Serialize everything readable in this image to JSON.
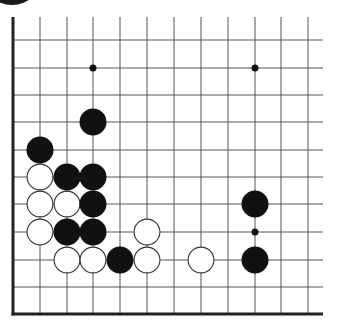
{
  "diagram": {
    "type": "go-board-fragment",
    "colors": {
      "background": "#ffffff",
      "line": "#555555",
      "border": "#222222",
      "black_stone": "#111111",
      "white_stone_fill": "#ffffff",
      "white_stone_outline": "#333333",
      "star_point": "#111111"
    },
    "grid": {
      "columns_x": [
        13,
        40,
        67,
        93,
        120,
        147,
        174,
        201,
        228,
        255,
        281,
        308
      ],
      "rows_y": [
        40,
        68,
        95,
        122,
        150,
        177,
        204,
        232,
        260,
        287,
        314
      ],
      "top_extent_y": 17,
      "right_extent_x": 323,
      "left_border": true,
      "bottom_border": true,
      "stone_radius": 13.5,
      "star_point_radius": 3.5
    },
    "star_points": [
      {
        "col": 3,
        "row": 1
      },
      {
        "col": 9,
        "row": 1
      },
      {
        "col": 9,
        "row": 7
      }
    ],
    "stones": [
      {
        "color": "black",
        "col": 3,
        "row": 3
      },
      {
        "color": "black",
        "col": 1,
        "row": 4
      },
      {
        "color": "white",
        "col": 1,
        "row": 5
      },
      {
        "color": "black",
        "col": 2,
        "row": 5
      },
      {
        "color": "black",
        "col": 3,
        "row": 5
      },
      {
        "color": "white",
        "col": 1,
        "row": 6
      },
      {
        "color": "white",
        "col": 2,
        "row": 6
      },
      {
        "color": "black",
        "col": 3,
        "row": 6
      },
      {
        "color": "black",
        "col": 9,
        "row": 6
      },
      {
        "color": "white",
        "col": 1,
        "row": 7
      },
      {
        "color": "black",
        "col": 2,
        "row": 7
      },
      {
        "color": "black",
        "col": 3,
        "row": 7
      },
      {
        "color": "white",
        "col": 5,
        "row": 7
      },
      {
        "color": "white",
        "col": 2,
        "row": 8
      },
      {
        "color": "white",
        "col": 3,
        "row": 8
      },
      {
        "color": "black",
        "col": 4,
        "row": 8
      },
      {
        "color": "white",
        "col": 5,
        "row": 8
      },
      {
        "color": "white",
        "col": 7,
        "row": 8
      },
      {
        "color": "black",
        "col": 9,
        "row": 8
      }
    ]
  }
}
